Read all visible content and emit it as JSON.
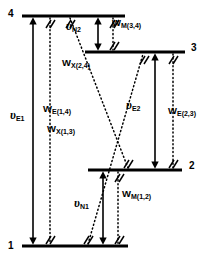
{
  "figure": {
    "kind": "four-level-energy-diagram",
    "background_color": "#ffffff",
    "line_color": "#000000"
  },
  "levels": [
    {
      "id": "level-4",
      "number": "4",
      "label_side": "left",
      "y": 16,
      "x1": 22,
      "x2": 125
    },
    {
      "id": "level-3",
      "number": "3",
      "label_side": "right",
      "y": 52,
      "x1": 85,
      "x2": 185
    },
    {
      "id": "level-2",
      "number": "2",
      "label_side": "right",
      "y": 170,
      "x1": 88,
      "x2": 182
    },
    {
      "id": "level-1",
      "number": "1",
      "label_side": "left",
      "y": 246,
      "x1": 22,
      "x2": 128
    }
  ],
  "transitions": [
    {
      "id": "nu-E1",
      "name": "nu-e1-arrow",
      "symbol": "υ",
      "subscript": "E1",
      "style": "solid",
      "kind": "double-arrow",
      "from_level": "4",
      "to_level": "1",
      "x": 33,
      "y1": 16,
      "y2": 246,
      "label_x": 12,
      "label_y": 115
    },
    {
      "id": "W-E1-4",
      "name": "w-e-1-4-arrow",
      "symbol": "W",
      "subscript": "E(1,4)",
      "style": "dotted",
      "kind": "line",
      "from_level": "1",
      "to_level": "4",
      "x": 50,
      "y1": 16,
      "y2": 246,
      "label_x": 43,
      "label_y": 108
    },
    {
      "id": "nu-N2",
      "name": "nu-n2-arrow",
      "symbol": "υ",
      "subscript": "N2",
      "style": "solid",
      "kind": "double-arrow",
      "from_level": "4",
      "to_level": "3",
      "x": 98,
      "y1": 16,
      "y2": 52,
      "label_x": 68,
      "label_y": 26
    },
    {
      "id": "W-M3-4",
      "name": "w-m-3-4-arrow",
      "symbol": "W",
      "subscript": "M(3,4)",
      "style": "dotted",
      "kind": "line",
      "from_level": "3",
      "to_level": "4",
      "x": 113,
      "y1": 16,
      "y2": 52,
      "label_x": 110,
      "label_y": 22
    },
    {
      "id": "nu-E2",
      "name": "nu-e2-arrow",
      "symbol": "υ",
      "subscript": "E2",
      "style": "solid",
      "kind": "double-arrow",
      "from_level": "3",
      "to_level": "2",
      "x": 155,
      "y1": 52,
      "y2": 170,
      "label_x": 128,
      "label_y": 104
    },
    {
      "id": "W-E2-3",
      "name": "w-e-2-3-arrow",
      "symbol": "W",
      "subscript": "E(2,3)",
      "style": "dotted",
      "kind": "line",
      "from_level": "2",
      "to_level": "3",
      "x": 173,
      "y1": 52,
      "y2": 170,
      "label_x": 168,
      "label_y": 110
    },
    {
      "id": "nu-N1",
      "name": "nu-n1-arrow",
      "symbol": "υ",
      "subscript": "N1",
      "style": "solid",
      "kind": "double-arrow",
      "from_level": "2",
      "to_level": "1",
      "x": 103,
      "y1": 170,
      "y2": 246,
      "label_x": 76,
      "label_y": 202
    },
    {
      "id": "W-M1-2",
      "name": "w-m-1-2-arrow",
      "symbol": "W",
      "subscript": "M(1,2)",
      "style": "dotted",
      "kind": "line",
      "from_level": "1",
      "to_level": "2",
      "x": 118,
      "y1": 170,
      "y2": 246,
      "label_x": 120,
      "label_y": 193
    },
    {
      "id": "W-X2-4",
      "name": "w-x-2-4-arrow",
      "symbol": "W",
      "subscript": "X(2,4)",
      "style": "dotted",
      "kind": "cross-line",
      "from_level": "2",
      "to_level": "4",
      "x1": 70,
      "y1": 16,
      "x2": 128,
      "y2": 170,
      "label_x": 63,
      "label_y": 62
    },
    {
      "id": "W-X1-3",
      "name": "w-x-1-3-arrow",
      "symbol": "W",
      "subscript": "X(1,3)",
      "style": "dotted",
      "kind": "cross-line",
      "from_level": "1",
      "to_level": "3",
      "x1": 88,
      "y1": 246,
      "x2": 143,
      "y2": 52,
      "label_x": 48,
      "label_y": 128
    }
  ]
}
